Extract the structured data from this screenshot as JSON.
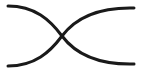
{
  "icon": {
    "name": "crossing-curves",
    "stroke_color": "#1a1a1a",
    "background": "#ffffff",
    "stroke_width": 3
  }
}
